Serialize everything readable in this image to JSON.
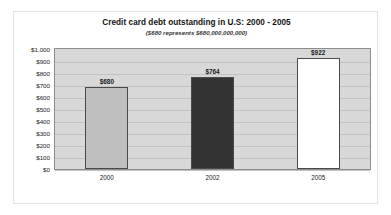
{
  "chart_data": {
    "type": "bar",
    "title": "Credit card debt outstanding in U.S: 2000 - 2005",
    "subtitle": "($680 represents $680,000,000,000)",
    "categories": [
      "2000",
      "2002",
      "2005"
    ],
    "values": [
      680,
      764,
      922
    ],
    "value_labels": [
      "$680",
      "$764",
      "$922"
    ],
    "xlabel": "",
    "ylabel": "",
    "ylim": [
      0,
      1000
    ],
    "ytick_step": 100,
    "ytick_labels": [
      "$1,000",
      "$900",
      "$800",
      "$700",
      "$600",
      "$500",
      "$400",
      "$300",
      "$200",
      "$100",
      "$0"
    ],
    "grid": true,
    "legend": false,
    "series": [
      {
        "name": "Credit card debt outstanding",
        "values": [
          680,
          764,
          922
        ]
      }
    ],
    "bar_colors": [
      "#bfbfbf",
      "#333333",
      "#ffffff"
    ],
    "bar_border_color": "#4a4a4a",
    "plot_background": "#d8d8d8",
    "gridline_color": "#c2c2c2",
    "frame_color": "#e3e3e3"
  }
}
